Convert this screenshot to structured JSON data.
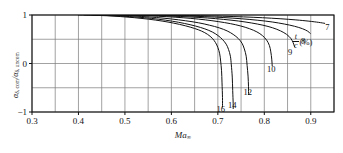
{
  "chart_data": {
    "type": "line",
    "title": "",
    "xlabel": "Ma∞",
    "ylabel": "αδ, com / αδ, uncom",
    "legend_title": "t/c (%)",
    "legend_numerator": "t",
    "legend_denominator": "c",
    "legend_unit": "(%)",
    "xlim": [
      0.3,
      0.95
    ],
    "ylim": [
      -1,
      1
    ],
    "xticks": [
      0.3,
      0.4,
      0.5,
      0.6,
      0.7,
      0.8,
      0.9
    ],
    "xticklabels": [
      "0.3",
      "0.4",
      "0.5",
      "0.6",
      "0.7",
      "0.8",
      "0.9"
    ],
    "x_minor_step": 0.05,
    "yticks": [
      1,
      0,
      -1
    ],
    "yticklabels": [
      "1",
      "0",
      "−1"
    ],
    "y_gridlines": [
      1,
      0.5,
      0,
      -0.5,
      -1
    ],
    "grid": true,
    "legend_position": "inside-right",
    "series": [
      {
        "name": "16",
        "label": "16",
        "label_x": 0.697,
        "label_y": -0.93,
        "points": [
          [
            0.4,
            1.0
          ],
          [
            0.43,
            0.995
          ],
          [
            0.46,
            0.985
          ],
          [
            0.49,
            0.968
          ],
          [
            0.52,
            0.945
          ],
          [
            0.55,
            0.915
          ],
          [
            0.58,
            0.875
          ],
          [
            0.605,
            0.832
          ],
          [
            0.63,
            0.778
          ],
          [
            0.65,
            0.722
          ],
          [
            0.665,
            0.668
          ],
          [
            0.678,
            0.6
          ],
          [
            0.688,
            0.52
          ],
          [
            0.695,
            0.43
          ],
          [
            0.7,
            0.33
          ],
          [
            0.704,
            0.2
          ],
          [
            0.706,
            0.05
          ],
          [
            0.708,
            -0.15
          ],
          [
            0.709,
            -0.4
          ],
          [
            0.71,
            -0.7
          ],
          [
            0.71,
            -0.9
          ]
        ]
      },
      {
        "name": "14",
        "label": "14",
        "label_x": 0.722,
        "label_y": -0.86,
        "points": [
          [
            0.413,
            1.0
          ],
          [
            0.445,
            0.995
          ],
          [
            0.478,
            0.985
          ],
          [
            0.51,
            0.968
          ],
          [
            0.542,
            0.945
          ],
          [
            0.573,
            0.912
          ],
          [
            0.602,
            0.872
          ],
          [
            0.628,
            0.826
          ],
          [
            0.652,
            0.772
          ],
          [
            0.672,
            0.714
          ],
          [
            0.688,
            0.65
          ],
          [
            0.7,
            0.578
          ],
          [
            0.71,
            0.495
          ],
          [
            0.718,
            0.398
          ],
          [
            0.723,
            0.29
          ],
          [
            0.727,
            0.15
          ],
          [
            0.729,
            -0.03
          ],
          [
            0.731,
            -0.28
          ],
          [
            0.732,
            -0.56
          ],
          [
            0.733,
            -0.83
          ],
          [
            0.733,
            -0.93
          ]
        ]
      },
      {
        "name": "12",
        "label": "12",
        "label_x": 0.755,
        "label_y": -0.58,
        "points": [
          [
            0.43,
            1.0
          ],
          [
            0.465,
            0.995
          ],
          [
            0.5,
            0.986
          ],
          [
            0.535,
            0.97
          ],
          [
            0.568,
            0.948
          ],
          [
            0.6,
            0.918
          ],
          [
            0.63,
            0.882
          ],
          [
            0.658,
            0.84
          ],
          [
            0.682,
            0.79
          ],
          [
            0.703,
            0.735
          ],
          [
            0.72,
            0.672
          ],
          [
            0.733,
            0.6
          ],
          [
            0.744,
            0.515
          ],
          [
            0.752,
            0.418
          ],
          [
            0.757,
            0.3
          ],
          [
            0.761,
            0.15
          ],
          [
            0.763,
            -0.04
          ],
          [
            0.765,
            -0.26
          ],
          [
            0.766,
            -0.48
          ],
          [
            0.766,
            -0.64
          ]
        ]
      },
      {
        "name": "10",
        "label": "10",
        "label_x": 0.806,
        "label_y": -0.12,
        "points": [
          [
            0.455,
            1.0
          ],
          [
            0.495,
            0.996
          ],
          [
            0.535,
            0.988
          ],
          [
            0.572,
            0.974
          ],
          [
            0.608,
            0.955
          ],
          [
            0.642,
            0.93
          ],
          [
            0.673,
            0.9
          ],
          [
            0.701,
            0.864
          ],
          [
            0.727,
            0.822
          ],
          [
            0.749,
            0.774
          ],
          [
            0.768,
            0.718
          ],
          [
            0.784,
            0.652
          ],
          [
            0.796,
            0.575
          ],
          [
            0.805,
            0.482
          ],
          [
            0.811,
            0.37
          ],
          [
            0.814,
            0.24
          ],
          [
            0.816,
            0.09
          ],
          [
            0.817,
            -0.05
          ]
        ]
      },
      {
        "name": "9",
        "label": "9",
        "label_x": 0.851,
        "label_y": 0.23,
        "points": [
          [
            0.47,
            1.0
          ],
          [
            0.515,
            0.996
          ],
          [
            0.558,
            0.989
          ],
          [
            0.6,
            0.977
          ],
          [
            0.64,
            0.96
          ],
          [
            0.678,
            0.938
          ],
          [
            0.712,
            0.91
          ],
          [
            0.744,
            0.876
          ],
          [
            0.772,
            0.836
          ],
          [
            0.797,
            0.79
          ],
          [
            0.818,
            0.736
          ],
          [
            0.835,
            0.672
          ],
          [
            0.848,
            0.6
          ],
          [
            0.857,
            0.518
          ],
          [
            0.862,
            0.43
          ],
          [
            0.865,
            0.35
          ]
        ]
      },
      {
        "name": "8",
        "label": "8",
        "label_x": 0.879,
        "label_y": 0.47,
        "points": [
          [
            0.485,
            1.0
          ],
          [
            0.535,
            0.997
          ],
          [
            0.583,
            0.991
          ],
          [
            0.628,
            0.981
          ],
          [
            0.672,
            0.966
          ],
          [
            0.713,
            0.947
          ],
          [
            0.751,
            0.922
          ],
          [
            0.786,
            0.892
          ],
          [
            0.817,
            0.856
          ],
          [
            0.843,
            0.814
          ],
          [
            0.865,
            0.768
          ],
          [
            0.882,
            0.718
          ],
          [
            0.893,
            0.668
          ],
          [
            0.899,
            0.62
          ]
        ]
      },
      {
        "name": "7",
        "label": "7",
        "label_x": 0.931,
        "label_y": 0.76,
        "points": [
          [
            0.505,
            1.0
          ],
          [
            0.56,
            0.998
          ],
          [
            0.613,
            0.993
          ],
          [
            0.663,
            0.986
          ],
          [
            0.71,
            0.975
          ],
          [
            0.755,
            0.961
          ],
          [
            0.796,
            0.944
          ],
          [
            0.834,
            0.923
          ],
          [
            0.868,
            0.899
          ],
          [
            0.896,
            0.873
          ],
          [
            0.917,
            0.848
          ],
          [
            0.93,
            0.828
          ]
        ]
      }
    ]
  },
  "axes": {
    "x_title_base": "Ma",
    "x_title_sub": "∞",
    "y_title_num_base": "α",
    "y_title_num_sub": "δ, com",
    "y_title_den_base": "α",
    "y_title_den_sub": "δ, uncom",
    "y_title_slash": "/"
  }
}
